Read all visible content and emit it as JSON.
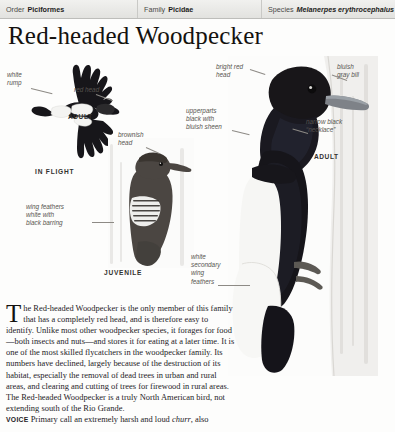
{
  "taxonomy": {
    "order_key": "Order",
    "order_value": "Piciformes",
    "family_key": "Family",
    "family_value": "Picidae",
    "species_key": "Species",
    "species_value": "Melanerpes erythrocephalus"
  },
  "title": "Red-headed Woodpecker",
  "annotations": {
    "white_rump": "white\nrump",
    "red_head": "red head",
    "brownish_head": "brownish\nhead",
    "wing_feathers": "wing feathers\nwhite with\nblack barring",
    "bright_red_head": "bright red\nhead",
    "bluish_gray_bill": "bluish\ngray bill",
    "upperparts": "upperparts\nblack with\nbluish sheen",
    "necklace": "narrow black\n“necklace”",
    "white_secondary": "white\nsecondary\nwing\nfeathers"
  },
  "captions": {
    "adult_flight": "ADULT",
    "in_flight": "IN FLIGHT",
    "juvenile": "JUVENILE",
    "adult_perched": "ADULT"
  },
  "body": {
    "dropcap": "T",
    "paragraph": "he Red-headed Woodpecker is the only member of this family that has a completely red head, and is therefore easy to identify. Unlike most other woodpecker species, it forages for food—both insects and nuts—and stores it for eating at a later time. It is one of the most skilled flycatchers in the woodpecker family. Its numbers have declined, largely because of the destruction of its habitat, especially the removal of dead trees in urban and rural areas, and clearing and cutting of trees for firewood in rural areas. The Red-headed Woodpecker is a truly North American bird, not extending south of the Rio Grande.",
    "voice_label": "VOICE",
    "voice_text_before": "Primary call an extremely harsh and loud ",
    "voice_call": "churr",
    "voice_text_after": ", also"
  },
  "colors": {
    "page_background": "#fdfdfc",
    "header_background": "#e8e8e6",
    "header_text": "#4a4a47",
    "title_text": "#14120f",
    "annotation_text": "#57544f",
    "leader_line": "#8d8a85",
    "plumage_black": "#17161a",
    "plumage_white": "#f4f4f2",
    "juvenile_brown": "#4b4642"
  }
}
